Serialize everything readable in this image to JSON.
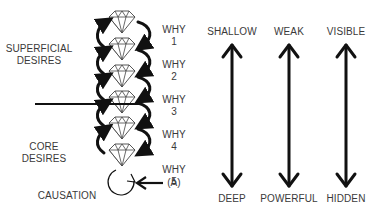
{
  "left_labels": {
    "superficial": [
      "SUPERFICIAL",
      "DESIRES"
    ],
    "core": [
      "CORE",
      "DESIRES"
    ],
    "causation": "CAUSATION"
  },
  "why_labels": [
    {
      "word": "WHY",
      "num": "1"
    },
    {
      "word": "WHY",
      "num": "2"
    },
    {
      "word": "WHY",
      "num": "3"
    },
    {
      "word": "WHY",
      "num": "4"
    },
    {
      "word": "WHY",
      "num": "5"
    }
  ],
  "pointer_label": "(A)",
  "scales": [
    {
      "top": "SHALLOW",
      "bottom": "DEEP"
    },
    {
      "top": "WEAK",
      "bottom": "POWERFUL"
    },
    {
      "top": "VISIBLE",
      "bottom": "HIDDEN"
    }
  ],
  "icons": {
    "diamond": "diamond-icon",
    "cycle_arrow": "curved-arrow-icon",
    "scale_arrow": "double-headed-arrow-icon"
  },
  "colors": {
    "ink": "#111111",
    "text": "#3a3a3a",
    "background": "#ffffff"
  }
}
